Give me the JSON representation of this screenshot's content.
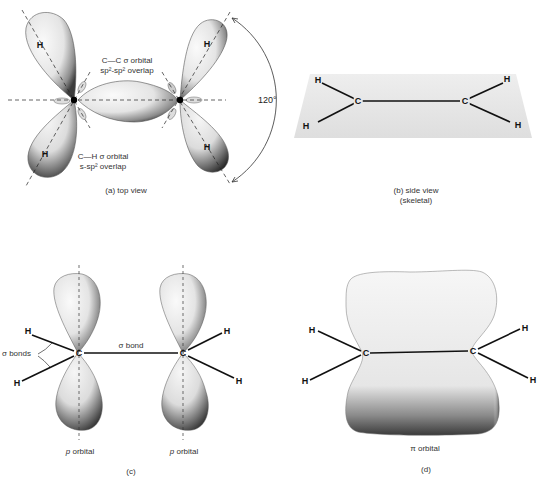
{
  "panels": {
    "a": {
      "caption": "(a)  top view",
      "cc_orbital_label_line1": "C—C σ orbital",
      "cc_orbital_label_line2": "sp²-sp² overlap",
      "ch_orbital_label_line1": "C—H σ orbital",
      "ch_orbital_label_line2": "s-sp² overlap",
      "angle_label": "120°",
      "atoms": {
        "h": "H"
      }
    },
    "b": {
      "caption_line1": "(b)  side view",
      "caption_line2": "(skeletal)",
      "atoms": {
        "h": "H",
        "c": "C"
      }
    },
    "c": {
      "caption": "(c)",
      "sigma_bonds_label": "σ bonds",
      "sigma_bond_label": "σ bond",
      "p_orbital_left": "p orbital",
      "p_orbital_right": "p orbital",
      "atoms": {
        "h": "H",
        "c": "C"
      }
    },
    "d": {
      "caption": "(d)",
      "pi_orbital_label": "π orbital",
      "atoms": {
        "h": "H",
        "c": "C"
      }
    }
  },
  "colors": {
    "background": "#ffffff",
    "line": "#111111",
    "lobe_light": "#f2f2f2",
    "lobe_shadow": "#5a5a5a",
    "plate": "#e6e6e6"
  }
}
